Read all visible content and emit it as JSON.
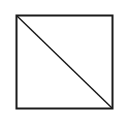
{
  "diagram": {
    "shape": "square-with-diagonal",
    "square": {
      "x": 16,
      "y": 15,
      "width": 96,
      "height": 93
    },
    "diagonal": {
      "from": "top-left",
      "to": "bottom-right"
    },
    "stroke_color": "#1a1a1a",
    "fill_color": "#ffffff",
    "background": "#ffffff"
  }
}
